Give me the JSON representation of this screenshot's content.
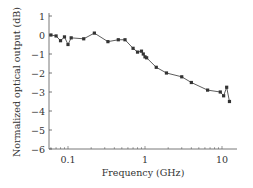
{
  "chart_data": {
    "type": "line",
    "title": "",
    "xlabel": "Frequency (GHz)",
    "ylabel": "Normalized optical output (dB)",
    "xscale": "log",
    "xlim": [
      0.06,
      20
    ],
    "ylim": [
      -6,
      1
    ],
    "grid": false,
    "legend": null,
    "x_ticks": [
      {
        "value": 0.1,
        "label": "0.1"
      },
      {
        "value": 1,
        "label": "1"
      },
      {
        "value": 10,
        "label": "10"
      }
    ],
    "y_ticks": [
      {
        "value": 1,
        "label": "1"
      },
      {
        "value": 0,
        "label": "0"
      },
      {
        "value": -1,
        "label": "−1"
      },
      {
        "value": -2,
        "label": "−2"
      },
      {
        "value": -3,
        "label": "−3"
      },
      {
        "value": -4,
        "label": "−4"
      },
      {
        "value": -5,
        "label": "−5"
      },
      {
        "value": -6,
        "label": "−6"
      }
    ],
    "series": [
      {
        "name": "Normalized optical output",
        "marker": "square",
        "color": "#333333",
        "x": [
          0.06,
          0.07,
          0.08,
          0.09,
          0.1,
          0.11,
          0.16,
          0.22,
          0.33,
          0.45,
          0.55,
          0.7,
          0.8,
          0.9,
          0.95,
          1.0,
          1.05,
          1.4,
          1.9,
          3.0,
          4.0,
          6.5,
          9.5,
          10.5,
          11.5,
          12.5
        ],
        "y": [
          0,
          -0.05,
          -0.3,
          -0.1,
          -0.5,
          -0.15,
          -0.2,
          0.1,
          -0.35,
          -0.25,
          -0.25,
          -0.7,
          -0.9,
          -0.85,
          -1.0,
          -1.15,
          -1.2,
          -1.7,
          -2.0,
          -2.2,
          -2.5,
          -2.9,
          -3.0,
          -3.2,
          -2.75,
          -3.5
        ]
      }
    ]
  },
  "layout": {
    "axis_x_px": 49,
    "axis_right_px": 237,
    "y_top_px": 15,
    "y_bottom_px": 149,
    "x_decade_px": 77,
    "x_at_0_1_px": 68
  }
}
